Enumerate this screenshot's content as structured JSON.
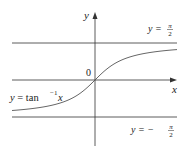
{
  "figure": {
    "function": "y = tan^-1 x",
    "axis_labels": {
      "x": "x",
      "y": "y"
    },
    "origin_label": "0",
    "asymptotes": [
      {
        "label_lhs": "y =",
        "label_num": "π",
        "label_den": "2",
        "value": 1.5708
      },
      {
        "label_lhs": "y = −",
        "label_num": "π",
        "label_den": "2",
        "value": -1.5708
      }
    ],
    "curve_label": {
      "lhs": "y = tan",
      "exp": "−1",
      "var": "x"
    },
    "colors": {
      "axes": "#333333",
      "asymptote": "#333333",
      "curve": "#555555",
      "text": "#222222"
    }
  },
  "chart_data": {
    "type": "line",
    "title": "",
    "xlabel": "x",
    "ylabel": "y",
    "series": [
      {
        "name": "y = tan^-1 x",
        "x": [
          -3.5,
          -2,
          -1,
          0,
          1,
          2,
          3.5
        ],
        "y": [
          -1.29,
          -1.107,
          -0.785,
          0,
          0.785,
          1.107,
          1.29
        ]
      }
    ],
    "reference_lines": [
      {
        "y": 1.5708,
        "label": "y = π/2"
      },
      {
        "y": -1.5708,
        "label": "y = −π/2"
      }
    ],
    "grid": false
  }
}
